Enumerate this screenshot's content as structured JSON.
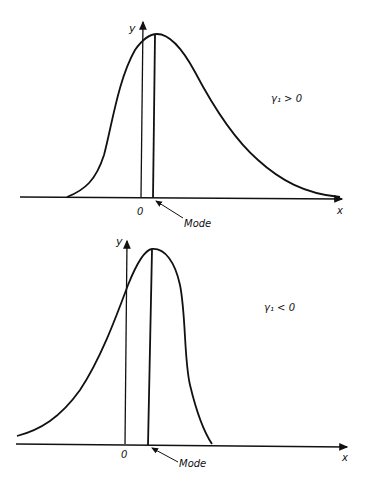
{
  "figure": {
    "panels": [
      {
        "id": "positive-skew",
        "condition_label": "γ₁ > 0",
        "y_axis_label": "y",
        "x_axis_label": "x",
        "origin_label": "0",
        "mode_label": "Mode"
      },
      {
        "id": "negative-skew",
        "condition_label": "γ₁ < 0",
        "y_axis_label": "y",
        "x_axis_label": "x",
        "origin_label": "0",
        "mode_label": "Mode"
      }
    ],
    "line_color": "#111111",
    "background": "#ffffff"
  }
}
